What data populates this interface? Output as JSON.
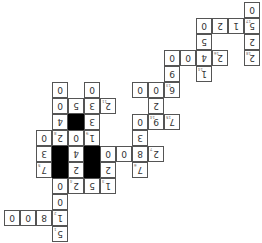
{
  "grid": {
    "cell_size": 16,
    "origin_x": 4,
    "origin_y": 2,
    "orientation": "rotated-180",
    "cells": [
      {
        "r": 0,
        "c": 15,
        "v": "0"
      },
      {
        "r": 1,
        "c": 12,
        "v": "0"
      },
      {
        "r": 1,
        "c": 13,
        "v": "2"
      },
      {
        "r": 1,
        "c": 14,
        "v": "1"
      },
      {
        "r": 1,
        "c": 15,
        "v": "5",
        "clue": "17"
      },
      {
        "r": 2,
        "c": 12,
        "v": "5"
      },
      {
        "r": 2,
        "c": 15,
        "v": "2"
      },
      {
        "r": 3,
        "c": 10,
        "v": "0"
      },
      {
        "r": 3,
        "c": 11,
        "v": "0"
      },
      {
        "r": 3,
        "c": 12,
        "v": "4"
      },
      {
        "r": 3,
        "c": 13,
        "v": "2",
        "clue": "16"
      },
      {
        "r": 3,
        "c": 15,
        "v": "2",
        "clue": "18"
      },
      {
        "r": 4,
        "c": 10,
        "v": "9"
      },
      {
        "r": 4,
        "c": 12,
        "v": "1",
        "clue": "14"
      },
      {
        "r": 5,
        "c": 3,
        "v": "0"
      },
      {
        "r": 5,
        "c": 5,
        "v": "0"
      },
      {
        "r": 5,
        "c": 8,
        "v": "0"
      },
      {
        "r": 5,
        "c": 9,
        "v": "0"
      },
      {
        "r": 5,
        "c": 10,
        "v": "6",
        "clue": "13"
      },
      {
        "r": 6,
        "c": 3,
        "v": "0"
      },
      {
        "r": 6,
        "c": 4,
        "v": "5"
      },
      {
        "r": 6,
        "c": 5,
        "v": "3"
      },
      {
        "r": 6,
        "c": 6,
        "v": "2",
        "clue": "11"
      },
      {
        "r": 6,
        "c": 9,
        "v": "2"
      },
      {
        "r": 7,
        "c": 3,
        "v": "4"
      },
      {
        "r": 7,
        "c": 4,
        "block": true
      },
      {
        "r": 7,
        "c": 5,
        "v": "3"
      },
      {
        "r": 7,
        "c": 8,
        "v": "0"
      },
      {
        "r": 7,
        "c": 9,
        "v": "9",
        "clue": "14"
      },
      {
        "r": 7,
        "c": 10,
        "v": "7",
        "clue": "15"
      },
      {
        "r": 8,
        "c": 2,
        "v": "0"
      },
      {
        "r": 8,
        "c": 3,
        "v": "2",
        "clue": "8"
      },
      {
        "r": 8,
        "c": 4,
        "v": "0"
      },
      {
        "r": 8,
        "c": 5,
        "v": "1",
        "clue": "9"
      },
      {
        "r": 8,
        "c": 8,
        "v": "3"
      },
      {
        "r": 9,
        "c": 2,
        "v": "3"
      },
      {
        "r": 9,
        "c": 3,
        "block": true
      },
      {
        "r": 9,
        "c": 4,
        "v": "4"
      },
      {
        "r": 9,
        "c": 5,
        "block": true
      },
      {
        "r": 9,
        "c": 6,
        "v": "0"
      },
      {
        "r": 9,
        "c": 7,
        "v": "0"
      },
      {
        "r": 9,
        "c": 8,
        "v": "8"
      },
      {
        "r": 9,
        "c": 9,
        "v": "2",
        "clue": "7"
      },
      {
        "r": 10,
        "c": 2,
        "v": "7",
        "clue": "5"
      },
      {
        "r": 10,
        "c": 3,
        "block": true
      },
      {
        "r": 10,
        "c": 4,
        "v": "2"
      },
      {
        "r": 10,
        "c": 5,
        "block": true
      },
      {
        "r": 10,
        "c": 6,
        "v": "2"
      },
      {
        "r": 10,
        "c": 8,
        "v": "7",
        "clue": "6"
      },
      {
        "r": 11,
        "c": 3,
        "v": "0"
      },
      {
        "r": 11,
        "c": 4,
        "v": "2",
        "clue": "4"
      },
      {
        "r": 11,
        "c": 5,
        "v": "5"
      },
      {
        "r": 11,
        "c": 6,
        "v": "1",
        "clue": "3"
      },
      {
        "r": 12,
        "c": 3,
        "v": "0"
      },
      {
        "r": 13,
        "c": 0,
        "v": "0"
      },
      {
        "r": 13,
        "c": 1,
        "v": "0"
      },
      {
        "r": 13,
        "c": 2,
        "v": "8"
      },
      {
        "r": 13,
        "c": 3,
        "v": "1",
        "clue": "2"
      },
      {
        "r": 14,
        "c": 3,
        "v": "5",
        "clue": "1"
      }
    ]
  }
}
